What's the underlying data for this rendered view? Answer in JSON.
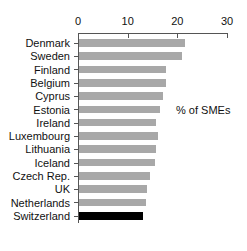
{
  "chart_data": {
    "type": "bar",
    "orientation": "horizontal",
    "title": "",
    "xlabel": "",
    "ylabel": "",
    "annotation": "% of SMEs",
    "xlim": [
      0,
      30
    ],
    "xticks": [
      0,
      10,
      20,
      30
    ],
    "xtick_labels": [
      "0",
      "10",
      "20",
      "30"
    ],
    "grid": false,
    "legend": "none",
    "categories": [
      "Denmark",
      "Sweden",
      "Finland",
      "Belgium",
      "Cyprus",
      "Estonia",
      "Ireland",
      "Luxembourg",
      "Lithuania",
      "Iceland",
      "Czech Rep.",
      "UK",
      "Netherlands",
      "Switzerland"
    ],
    "values": [
      21.5,
      21.0,
      17.8,
      17.8,
      17.1,
      16.5,
      15.8,
      16.1,
      15.8,
      15.5,
      14.5,
      13.8,
      13.6,
      13.0
    ],
    "highlight_category": "Switzerland",
    "colors": {
      "bar": "#a8a8a8",
      "highlight_bar": "#000000",
      "axis": "#555555",
      "text": "#111111",
      "background": "#ffffff"
    }
  }
}
